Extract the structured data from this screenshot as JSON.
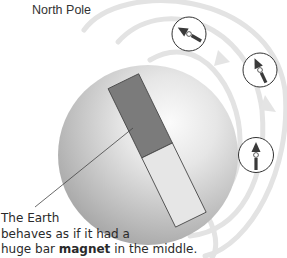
{
  "labels": {
    "north_pole": "North Pole",
    "caption_line1": "The Earth",
    "caption_line2": "behaves as if it had a",
    "caption_line3_pre": "huge bar ",
    "caption_line3_bold": "magnet",
    "caption_line3_post": " in the middle."
  },
  "diagram": {
    "elements": [
      {
        "name": "earth-sphere",
        "shape": "circle"
      },
      {
        "name": "bar-magnet",
        "poles": [
          "north (dark)",
          "south (light)"
        ]
      },
      {
        "name": "field-lines",
        "count": 3
      },
      {
        "name": "compass",
        "count": 3
      }
    ],
    "colors": {
      "earth_light": "#f4f4f4",
      "earth_dark": "#9a9a9a",
      "magnet_dark": "#7a7a7a",
      "magnet_light": "#e6e6e6",
      "field_line": "#e2e2e2",
      "compass_needle": "#3a3a3a",
      "text": "#333333"
    }
  }
}
